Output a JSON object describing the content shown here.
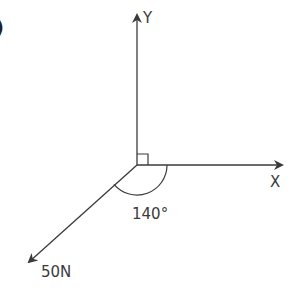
{
  "part_label": ")",
  "axes": {
    "y_label": "Y",
    "x_label": "X"
  },
  "force": {
    "magnitude_label": "50N",
    "angle_label": "140°",
    "angle_deg": 140,
    "angle_reference": "measured clockwise from positive X axis"
  },
  "right_angle_marker": true,
  "colors": {
    "line": "#3a3a3a",
    "background": "#ffffff"
  }
}
